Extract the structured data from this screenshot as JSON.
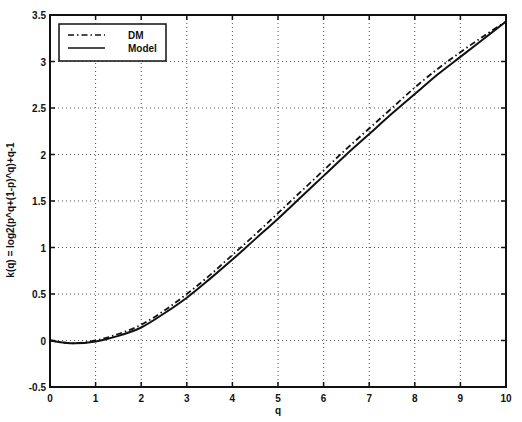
{
  "chart_data": {
    "type": "line",
    "title": "",
    "xlabel": "q",
    "ylabel": "k(q) = log2(p^q+(1-p)^q)+q-1",
    "xlim": [
      0,
      10
    ],
    "ylim": [
      -0.5,
      3.5
    ],
    "xticks": [
      "0",
      "1",
      "2",
      "3",
      "4",
      "5",
      "6",
      "7",
      "8",
      "9",
      "10"
    ],
    "yticks": [
      "-0.5",
      "0",
      "0.5",
      "1",
      "1.5",
      "2",
      "2.5",
      "3",
      "3.5"
    ],
    "grid": true,
    "legend_position": "upper left",
    "x": [
      0,
      0.5,
      1,
      1.5,
      2,
      2.5,
      3,
      3.5,
      4,
      4.5,
      5,
      5.5,
      6,
      6.5,
      7,
      7.5,
      8,
      8.5,
      9,
      9.5,
      10
    ],
    "series": [
      {
        "name": "DM",
        "style": "dash-dot",
        "values": [
          0,
          -0.03,
          0.0,
          0.07,
          0.17,
          0.32,
          0.5,
          0.7,
          0.92,
          1.14,
          1.37,
          1.6,
          1.83,
          2.06,
          2.28,
          2.5,
          2.72,
          2.92,
          3.1,
          3.27,
          3.43
        ]
      },
      {
        "name": "Model",
        "style": "solid",
        "values": [
          0,
          -0.03,
          -0.01,
          0.05,
          0.14,
          0.29,
          0.46,
          0.66,
          0.87,
          1.09,
          1.31,
          1.54,
          1.77,
          2.0,
          2.22,
          2.44,
          2.65,
          2.86,
          3.05,
          3.24,
          3.43
        ]
      }
    ]
  },
  "legend": {
    "entries": [
      {
        "label": "DM",
        "style": "dash-dot"
      },
      {
        "label": "Model",
        "style": "solid"
      }
    ]
  },
  "colors": {
    "line": "#111111",
    "grid": "#555555",
    "background": "#ffffff"
  }
}
